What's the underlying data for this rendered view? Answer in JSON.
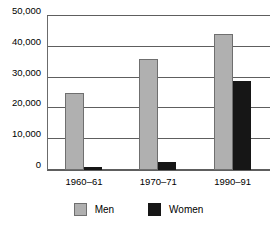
{
  "chart_data": {
    "type": "bar",
    "title": "",
    "subtitle": "",
    "xlabel": "",
    "ylabel": "",
    "categories": [
      "1960–61",
      "1970–71",
      "1990–91"
    ],
    "series": [
      {
        "name": "Men",
        "color": "#b0b0b0",
        "values": [
          25000,
          36000,
          44000
        ]
      },
      {
        "name": "Women",
        "color": "#161616",
        "values": [
          1000,
          2700,
          29000
        ]
      }
    ],
    "ylim": [
      0,
      50000
    ],
    "yticks": [
      0,
      10000,
      20000,
      30000,
      40000,
      50000
    ],
    "ytick_labels": [
      "0",
      "10,000",
      "20,000",
      "30,000",
      "40,000",
      "50,000"
    ],
    "grid": true,
    "grid_axis": "y",
    "legend": true,
    "legend_position": "bottom",
    "legend_entries": [
      "Men",
      "Women"
    ],
    "annotations": []
  },
  "axis": {
    "line_color": "#5e5e5e",
    "grid_color": "#5e5e5e"
  }
}
